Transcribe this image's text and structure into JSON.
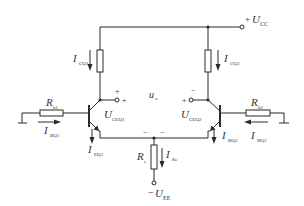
{
  "diagram": {
    "type": "differential-amplifier-circuit",
    "colors": {
      "line": "#2b2b2b",
      "text": "#333333",
      "background": "#ffffff"
    },
    "labels": {
      "ucc": {
        "main": "U",
        "sub": "CC",
        "sign": "+"
      },
      "uee": {
        "main": "U",
        "sub": "EE",
        "sign": "−"
      },
      "ic1": {
        "main": "I",
        "sub": "CQ1"
      },
      "ic2": {
        "main": "I",
        "sub": "CQ2"
      },
      "uo": {
        "main": "u",
        "sub": "o"
      },
      "uce1": {
        "main": "U",
        "sub": "CEQ1"
      },
      "uce2": {
        "main": "U",
        "sub": "CEQ2"
      },
      "rb1": {
        "main": "R",
        "sub": "b1"
      },
      "rb2": {
        "main": "R",
        "sub": "b2"
      },
      "ib1": {
        "main": "I",
        "sub": "BQ1"
      },
      "ib2a": {
        "main": "I",
        "sub": "BQ2"
      },
      "ib2b": {
        "main": "I",
        "sub": "BQ2"
      },
      "ie1": {
        "main": "I",
        "sub": "EQ1"
      },
      "re": {
        "main": "R",
        "sub": "e"
      },
      "ire": {
        "main": "I",
        "sub": "Re"
      }
    },
    "signs": {
      "left_out_top": "+",
      "left_out_right": "+",
      "right_out_top": "−",
      "right_out_left": "+",
      "emitter_left": "−",
      "emitter_right": "−"
    }
  }
}
